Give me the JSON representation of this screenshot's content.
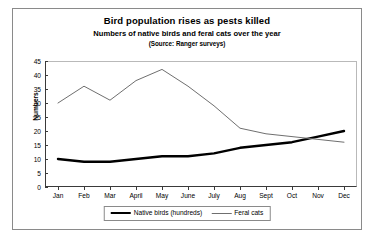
{
  "chart_data": {
    "type": "line",
    "title": "Bird population rises as pests killed",
    "subtitle": "Numbers of native birds and feral cats over the year",
    "source": "(Source: Ranger surveys)",
    "xlabel": "",
    "ylabel": "Numbers",
    "categories": [
      "Jan",
      "Feb",
      "Mar",
      "April",
      "May",
      "June",
      "July",
      "Aug",
      "Sept",
      "Oct",
      "Nov",
      "Dec"
    ],
    "ylim": [
      0,
      45
    ],
    "yticks": [
      0,
      5,
      10,
      15,
      20,
      25,
      30,
      35,
      40,
      45
    ],
    "grid": false,
    "legend_position": "bottom",
    "series": [
      {
        "name": "Native birds (hundreds)",
        "values": [
          10,
          9,
          9,
          10,
          11,
          11,
          12,
          14,
          15,
          16,
          18,
          20
        ],
        "color": "#000000",
        "width": 2.4
      },
      {
        "name": "Feral cats",
        "values": [
          30,
          36,
          31,
          38,
          42,
          36,
          29,
          21,
          19,
          18,
          17,
          16
        ],
        "color": "#6f6f6f",
        "width": 1
      }
    ]
  }
}
